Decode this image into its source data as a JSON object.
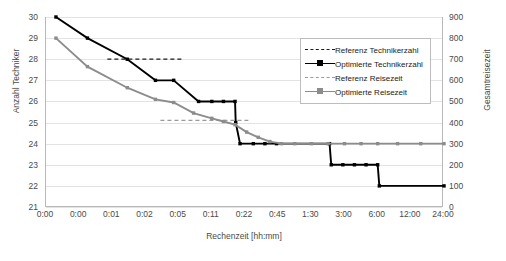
{
  "chart_data": {
    "type": "line",
    "title": "",
    "xlabel": "Rechenzeit [hh:mm]",
    "ylabel": "Anzahl Techniker",
    "y2label": "Gesamtreisezeit",
    "grid": true,
    "legend_position": "top-right",
    "x_tick_labels": [
      "0:00",
      "0:00",
      "0:01",
      "0:02",
      "0:05",
      "0:11",
      "0:22",
      "0:45",
      "1:30",
      "3:00",
      "6:00",
      "12:00",
      "24:00"
    ],
    "y_tick_labels": [
      "21",
      "22",
      "23",
      "24",
      "25",
      "26",
      "27",
      "28",
      "29",
      "30"
    ],
    "y2_tick_labels": [
      "0",
      "100",
      "200",
      "300",
      "400",
      "500",
      "600",
      "700",
      "800",
      "900"
    ],
    "ylim": [
      21,
      30
    ],
    "y2lim": [
      0,
      900
    ],
    "xlim_index": [
      0,
      12
    ],
    "series": [
      {
        "name": "Referenz Technikerzahl",
        "axis": "left",
        "style": "dashed",
        "color": "#1a1a1a",
        "markers": false,
        "points": [
          {
            "x": 1.85,
            "y": 28
          },
          {
            "x": 4.15,
            "y": 28
          }
        ]
      },
      {
        "name": "Optimierte Technikerzahl",
        "axis": "left",
        "style": "solid",
        "color": "#000000",
        "markers": true,
        "points": [
          {
            "x": 0.3,
            "y": 30
          },
          {
            "x": 1.25,
            "y": 29
          },
          {
            "x": 2.45,
            "y": 28
          },
          {
            "x": 3.3,
            "y": 27
          },
          {
            "x": 3.85,
            "y": 27
          },
          {
            "x": 4.6,
            "y": 26
          },
          {
            "x": 5.0,
            "y": 26
          },
          {
            "x": 5.35,
            "y": 26
          },
          {
            "x": 5.7,
            "y": 26
          },
          {
            "x": 5.72,
            "y": 25
          },
          {
            "x": 5.85,
            "y": 24
          },
          {
            "x": 6.25,
            "y": 24
          },
          {
            "x": 6.6,
            "y": 24
          },
          {
            "x": 6.95,
            "y": 24
          },
          {
            "x": 8.55,
            "y": 24
          },
          {
            "x": 8.6,
            "y": 23
          },
          {
            "x": 8.95,
            "y": 23
          },
          {
            "x": 9.3,
            "y": 23
          },
          {
            "x": 9.65,
            "y": 23
          },
          {
            "x": 10.0,
            "y": 23
          },
          {
            "x": 10.05,
            "y": 22
          },
          {
            "x": 12.0,
            "y": 22
          }
        ]
      },
      {
        "name": "Referenz Reisezeit",
        "axis": "left",
        "style": "dashed",
        "color": "#9a9a9a",
        "markers": false,
        "points": [
          {
            "x": 3.45,
            "y": 25.1
          },
          {
            "x": 6.1,
            "y": 25.1
          }
        ]
      },
      {
        "name": "Optimierte Reisezeit",
        "axis": "left",
        "style": "solid",
        "color": "#8c8c8c",
        "markers": true,
        "points": [
          {
            "x": 0.3,
            "y": 29.0
          },
          {
            "x": 1.25,
            "y": 27.65
          },
          {
            "x": 2.45,
            "y": 26.65
          },
          {
            "x": 3.3,
            "y": 26.1
          },
          {
            "x": 3.85,
            "y": 25.95
          },
          {
            "x": 4.45,
            "y": 25.45
          },
          {
            "x": 5.0,
            "y": 25.2
          },
          {
            "x": 5.35,
            "y": 25.05
          },
          {
            "x": 5.7,
            "y": 24.9
          },
          {
            "x": 6.05,
            "y": 24.55
          },
          {
            "x": 6.4,
            "y": 24.3
          },
          {
            "x": 6.75,
            "y": 24.1
          },
          {
            "x": 7.1,
            "y": 24.0
          },
          {
            "x": 7.5,
            "y": 24.0
          },
          {
            "x": 8.0,
            "y": 24.0
          },
          {
            "x": 8.5,
            "y": 24.0
          },
          {
            "x": 9.0,
            "y": 24.0
          },
          {
            "x": 9.5,
            "y": 24.0
          },
          {
            "x": 10.0,
            "y": 24.0
          },
          {
            "x": 10.6,
            "y": 24.0
          },
          {
            "x": 11.3,
            "y": 24.0
          },
          {
            "x": 12.0,
            "y": 24.0
          }
        ]
      }
    ]
  },
  "legend": {
    "items": [
      {
        "label": "Referenz Technikerzahl"
      },
      {
        "label": "Optimierte Technikerzahl"
      },
      {
        "label": "Referenz Reisezeit"
      },
      {
        "label": "Optimierte Reisezeit"
      }
    ]
  }
}
